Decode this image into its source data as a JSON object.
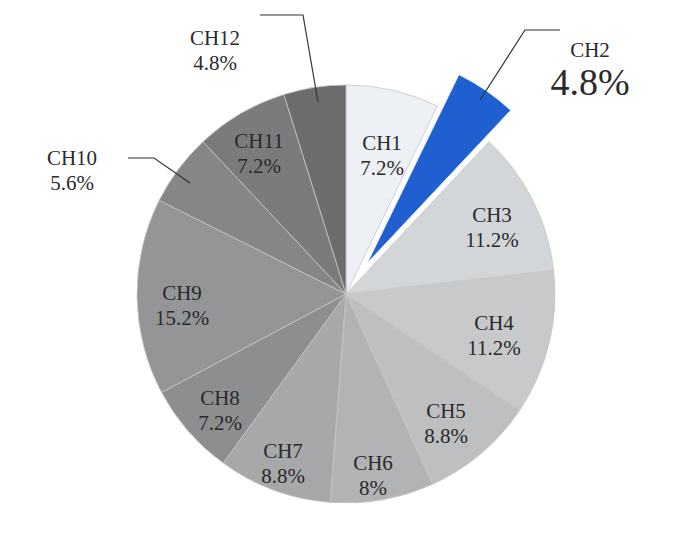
{
  "chart_data": {
    "type": "pie",
    "title": "",
    "start_angle": "12 o'clock, clockwise",
    "categories": [
      "CH1",
      "CH2",
      "CH3",
      "CH4",
      "CH5",
      "CH6",
      "CH7",
      "CH8",
      "CH9",
      "CH10",
      "CH11",
      "CH12"
    ],
    "values": [
      7.2,
      4.8,
      11.2,
      11.2,
      8.8,
      8,
      8.8,
      7.2,
      15.2,
      5.6,
      7.2,
      4.8
    ],
    "value_labels": [
      "7.2%",
      "4.8%",
      "11.2%",
      "11.2%",
      "8.8%",
      "8%",
      "8.8%",
      "7.2%",
      "15.2%",
      "5.6%",
      "7.2%",
      "4.8%"
    ],
    "exploded": [
      "CH2"
    ],
    "colors": [
      "#edf1f5",
      "#1f5fd0",
      "#d3d6d9",
      "#c7c9cb",
      "#bdbfc1",
      "#b1b3b5",
      "#a6a8aa",
      "#8c8e90",
      "#939597",
      "#858688",
      "#7a7b7d",
      "#6c6d6f"
    ],
    "legend": "none (direct labels)"
  }
}
